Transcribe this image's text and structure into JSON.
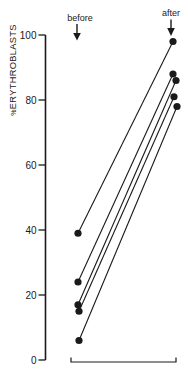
{
  "chart_data": {
    "type": "line",
    "subtype": "paired-before-after-slope-chart",
    "title": "",
    "ylabel": "%ERYTHROBLASTS",
    "ylabel_prefix": "%",
    "ylabel_main": "ERYTHROBLASTS",
    "xlabel": "",
    "categories": [
      "before",
      "after"
    ],
    "pairs": [
      [
        39,
        98
      ],
      [
        24,
        88
      ],
      [
        17,
        86
      ],
      [
        15,
        81
      ],
      [
        6,
        78
      ]
    ],
    "ylim": [
      0,
      100
    ],
    "yticks": [
      0,
      20,
      40,
      60,
      80,
      100
    ],
    "grid": false,
    "legend": false,
    "marker": "filled-circle",
    "ink_color": "#1a1a1a",
    "background_color": "#ffffff",
    "annotations": [
      "down-arrow-icon under before label",
      "down-arrow-icon under after label",
      "range-bracket along bottom between columns"
    ]
  },
  "labels": {
    "before": "before",
    "after": "after"
  }
}
